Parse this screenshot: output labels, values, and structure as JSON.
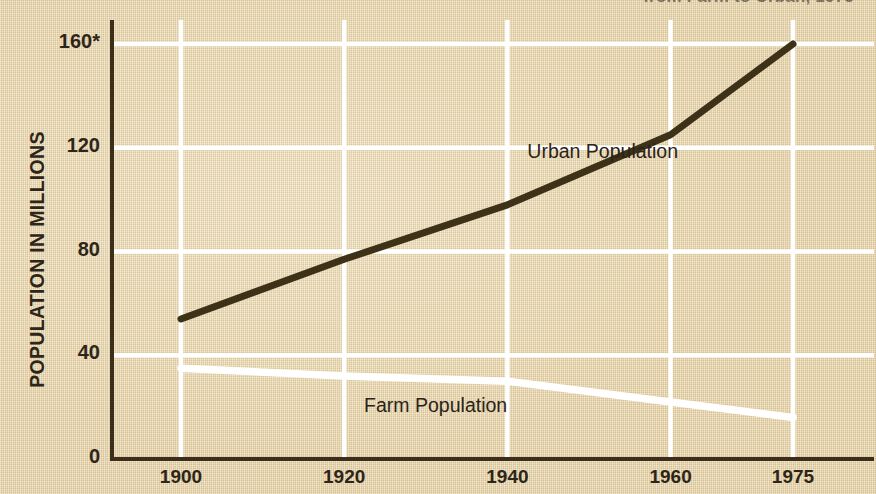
{
  "headline": {
    "text": "from Farm to Urban, 1975"
  },
  "chart_data": {
    "type": "line",
    "title": "",
    "xlabel": "",
    "ylabel": "POPULATION IN MILLIONS",
    "x": [
      1900,
      1920,
      1940,
      1960,
      1975
    ],
    "xlim": [
      1900,
      1975
    ],
    "ylim": [
      0,
      160
    ],
    "yticks": [
      0,
      40,
      80,
      120,
      160
    ],
    "ytick_labels": [
      "0",
      "40",
      "80",
      "120",
      "160*"
    ],
    "xtick_labels": [
      "1900",
      "1920",
      "1940",
      "1960",
      "1975"
    ],
    "grid": true,
    "grid_color": "#ffffff",
    "legend": "inline-labels",
    "background": "#e7d4a9",
    "axis_color": "#3b2f1c",
    "series": [
      {
        "name": "Urban Population",
        "color": "#3d3118",
        "values": [
          54,
          77,
          98,
          125,
          160
        ],
        "label_x": 1952,
        "label_y": 118
      },
      {
        "name": "Farm Population",
        "color": "#ffffff",
        "values": [
          35,
          32,
          30,
          22,
          16
        ],
        "label_x": 1932,
        "label_y": 20
      }
    ]
  }
}
